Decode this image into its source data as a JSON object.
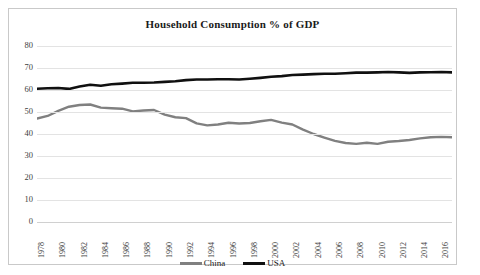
{
  "chart_data": {
    "type": "line",
    "title": "Household Consumption % of GDP",
    "xlabel": "",
    "ylabel": "",
    "ylim": [
      0,
      80
    ],
    "yticks": [
      0,
      10,
      20,
      30,
      40,
      50,
      60,
      70,
      80
    ],
    "xlim": [
      1978,
      2017
    ],
    "grid": true,
    "legend_position": "bottom",
    "categories": [
      1978,
      1979,
      1980,
      1981,
      1982,
      1983,
      1984,
      1985,
      1986,
      1987,
      1988,
      1989,
      1990,
      1991,
      1992,
      1993,
      1994,
      1995,
      1996,
      1997,
      1998,
      1999,
      2000,
      2001,
      2002,
      2003,
      2004,
      2005,
      2006,
      2007,
      2008,
      2009,
      2010,
      2011,
      2012,
      2013,
      2014,
      2015,
      2016,
      2017
    ],
    "xtick_labels": [
      "1978",
      "1980",
      "1982",
      "1984",
      "1986",
      "1988",
      "1990",
      "1992",
      "1994",
      "1996",
      "1998",
      "2000",
      "2002",
      "2004",
      "2006",
      "2008",
      "2010",
      "2012",
      "2014",
      "2016"
    ],
    "series": [
      {
        "name": "China",
        "color": "#808080",
        "values": [
          47.0,
          48.2,
          50.5,
          52.4,
          53.2,
          53.4,
          52.0,
          51.7,
          51.5,
          50.3,
          50.7,
          50.9,
          48.8,
          47.6,
          47.2,
          44.8,
          43.9,
          44.3,
          45.1,
          44.8,
          45.0,
          45.8,
          46.4,
          45.2,
          44.3,
          42.0,
          40.0,
          38.4,
          36.9,
          35.9,
          35.5,
          36.0,
          35.5,
          36.5,
          36.8,
          37.3,
          38.0,
          38.5,
          38.7,
          38.5
        ]
      },
      {
        "name": "USA",
        "color": "#101010",
        "values": [
          60.6,
          60.8,
          60.9,
          60.5,
          61.6,
          62.4,
          61.9,
          62.6,
          62.9,
          63.3,
          63.3,
          63.4,
          63.7,
          64.0,
          64.5,
          64.8,
          64.8,
          64.9,
          64.9,
          64.8,
          65.1,
          65.5,
          66.0,
          66.3,
          66.8,
          67.0,
          67.2,
          67.4,
          67.4,
          67.6,
          67.9,
          67.9,
          68.0,
          68.2,
          68.0,
          67.8,
          68.0,
          68.1,
          68.2,
          68.0
        ]
      }
    ]
  },
  "legend": {
    "entries": [
      {
        "label": "China",
        "color": "#808080"
      },
      {
        "label": "USA",
        "color": "#101010"
      }
    ]
  },
  "frame": {
    "border_color": "#c9c9c9",
    "background": "#ffffff"
  }
}
